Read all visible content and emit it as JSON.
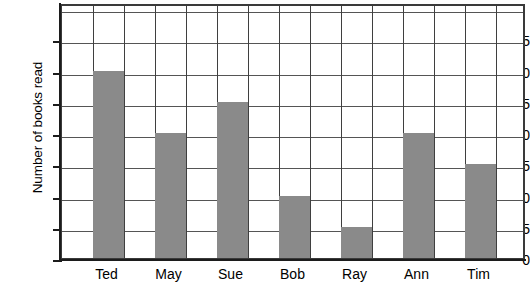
{
  "chart_data": {
    "type": "bar",
    "title": "",
    "xlabel": "",
    "ylabel": "Number of books read",
    "categories": [
      "Ted",
      "May",
      "Sue",
      "Bob",
      "Ray",
      "Ann",
      "Tim"
    ],
    "values": [
      30,
      20,
      25,
      10,
      5,
      20,
      15
    ],
    "ylim": [
      0,
      41
    ],
    "ytick_labels": [
      "0",
      "5",
      "10",
      "15",
      "20",
      "25",
      "30",
      "35"
    ],
    "ytick_values": [
      0,
      5,
      10,
      15,
      20,
      25,
      30,
      35
    ],
    "gridline_step": 5,
    "grid": "both",
    "legend": "none",
    "bar_color": "#8a8a8a",
    "grid_color": "#555555",
    "axis_color": "#1c1c1c",
    "background": "#ffffff"
  }
}
